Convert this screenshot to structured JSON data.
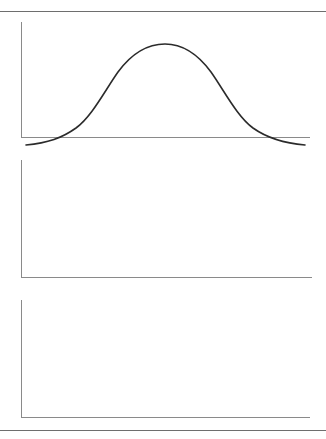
{
  "page": {
    "background_color": "#ffffff",
    "width": 326,
    "height": 439,
    "rules": [
      {
        "name": "top-rule",
        "y": 11,
        "color": "#6e6e6e"
      },
      {
        "name": "bottom-rule",
        "y": 430,
        "color": "#6e6e6e"
      }
    ]
  },
  "style": {
    "curve_color": "#2b2b2b",
    "curve_width": 1.6,
    "axis_color": "#8a8a8a",
    "axis_width": 1
  },
  "chart_data": [
    {
      "type": "line",
      "name": "symmetric-unimodal-distribution",
      "title": "",
      "subtitle": "",
      "xlabel": "",
      "ylabel": "",
      "grid": false,
      "legend": false,
      "xlim": [
        0,
        100
      ],
      "ylim": [
        0,
        100
      ],
      "axis": {
        "x_start": 21,
        "x_end": 310,
        "baseline_y": 137,
        "top_y": 22
      },
      "peaks": [
        {
          "x": 50,
          "y": 92
        }
      ],
      "x": [
        2,
        6,
        10,
        14,
        18,
        22,
        26,
        30,
        34,
        38,
        42,
        46,
        50,
        54,
        58,
        62,
        66,
        70,
        74,
        78,
        82,
        86,
        90,
        94,
        98
      ],
      "values": [
        3,
        4,
        5,
        7,
        10,
        15,
        23,
        34,
        48,
        63,
        77,
        87,
        92,
        91,
        85,
        74,
        60,
        45,
        32,
        22,
        15,
        10,
        7,
        5,
        4
      ],
      "svg_path": "M 26,133 C 48,131 62,126 76,116 C 92,104 104,80 118,60 C 132,41 148,32 165,32 C 182,32 197,41 211,60 C 225,80 237,104 253,116 C 267,126 282,131 305,133"
    },
    {
      "type": "line",
      "name": "bimodal-distribution",
      "title": "",
      "subtitle": "",
      "xlabel": "",
      "ylabel": "",
      "grid": false,
      "legend": false,
      "xlim": [
        0,
        100
      ],
      "ylim": [
        0,
        100
      ],
      "axis": {
        "x_start": 21,
        "x_end": 312,
        "baseline_y": 277,
        "top_y": 160
      },
      "peaks": [
        {
          "x": 30,
          "y": 88
        },
        {
          "x": 67,
          "y": 88
        }
      ],
      "trough": {
        "x": 48,
        "y": 70
      },
      "x": [
        2,
        6,
        10,
        14,
        18,
        22,
        26,
        30,
        34,
        38,
        42,
        46,
        50,
        54,
        58,
        62,
        66,
        70,
        74,
        78,
        82,
        86,
        90,
        94,
        98
      ],
      "values": [
        3,
        5,
        8,
        14,
        25,
        44,
        68,
        86,
        88,
        82,
        74,
        70,
        70,
        73,
        80,
        86,
        88,
        85,
        70,
        48,
        28,
        15,
        8,
        5,
        3
      ],
      "svg_path": "M 27,273 C 42,272 52,268 62,258 C 74,246 82,215 95,199 C 102,190 112,189 120,197 C 130,206 136,205 145,207 C 152,209 156,209 161,209 C 168,209 174,207 182,203 C 190,199 196,190 205,190 C 215,190 223,208 234,232 C 245,255 258,270 276,274 C 288,277 298,277 306,277"
    },
    {
      "type": "line",
      "name": "right-skewed-distribution",
      "title": "",
      "subtitle": "",
      "xlabel": "",
      "ylabel": "",
      "grid": false,
      "legend": false,
      "xlim": [
        0,
        100
      ],
      "ylim": [
        0,
        100
      ],
      "axis": {
        "x_start": 21,
        "x_end": 310,
        "baseline_y": 417,
        "top_y": 300
      },
      "peaks": [
        {
          "x": 27,
          "y": 94
        }
      ],
      "x": [
        0,
        4,
        8,
        12,
        16,
        20,
        24,
        28,
        32,
        36,
        40,
        44,
        48,
        52,
        56,
        60,
        64,
        68,
        72,
        76,
        80,
        84,
        88,
        92,
        96,
        100
      ],
      "values": [
        0,
        12,
        34,
        57,
        76,
        88,
        94,
        94,
        90,
        84,
        76,
        68,
        59,
        51,
        43,
        36,
        30,
        24,
        19,
        15,
        12,
        9,
        7,
        5,
        4,
        3
      ],
      "svg_path": "M 22,417 C 26,412 31,398 38,380 C 48,353 58,330 72,318 C 82,310 92,310 100,312 C 110,315 118,328 128,345 C 140,365 152,382 168,392 C 186,403 205,409 226,412 C 252,415 278,416 300,416"
    }
  ]
}
